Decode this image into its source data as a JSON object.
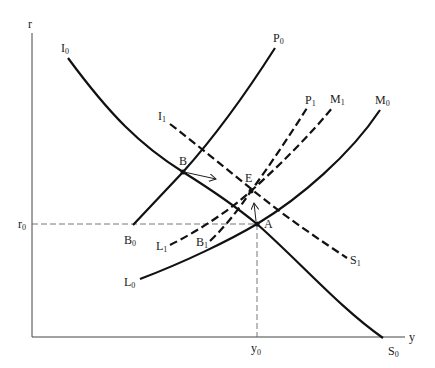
{
  "axes": {
    "y_label": "r",
    "x_label": "y",
    "r0_label": "r",
    "r0_sub": "0",
    "y0_label": "y",
    "y0_sub": "0"
  },
  "curves": {
    "I0": {
      "label": "I",
      "sub": "0",
      "end_label": "S",
      "end_sub": "0",
      "style": "solid"
    },
    "I1": {
      "label": "I",
      "sub": "1",
      "end_label": "S",
      "end_sub": "1",
      "style": "dashed"
    },
    "P0": {
      "label": "P",
      "sub": "0",
      "end_label": "B",
      "end_sub": "0",
      "style": "solid"
    },
    "P1": {
      "label": "P",
      "sub": "1",
      "end_label": "B",
      "end_sub": "1",
      "style": "dashed"
    },
    "M0": {
      "label": "M",
      "sub": "0",
      "end_label": "L",
      "end_sub": "0",
      "style": "solid"
    },
    "M1": {
      "label": "M",
      "sub": "1",
      "end_label": "L",
      "end_sub": "1",
      "style": "dashed"
    }
  },
  "points": {
    "A": "A",
    "B": "B",
    "E": "E"
  }
}
